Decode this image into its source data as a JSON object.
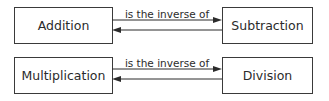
{
  "diagram": {
    "type": "relationship",
    "rows": [
      {
        "left": "Addition",
        "relation": "is the inverse of",
        "right": "Subtraction",
        "arrows": [
          "left-to-right",
          "right-to-left"
        ]
      },
      {
        "left": "Multiplication",
        "relation": "is the inverse of",
        "right": "Division",
        "arrows": [
          "left-to-right",
          "right-to-left"
        ]
      }
    ],
    "colors": {
      "text": "#2b2b2b",
      "border": "#3a3a3a",
      "arrow": "#2b2b2b",
      "background": "#ffffff"
    }
  }
}
